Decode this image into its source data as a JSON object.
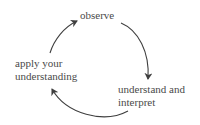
{
  "diagram": {
    "type": "cycle",
    "colors": {
      "text": "#4a4a4a",
      "arrow": "#3f3f3f"
    },
    "nodes": [
      {
        "id": "observe",
        "lines": [
          "observe"
        ]
      },
      {
        "id": "understand",
        "lines": [
          "understand and",
          "interpret"
        ]
      },
      {
        "id": "apply",
        "lines": [
          "apply your",
          "understanding"
        ]
      }
    ],
    "edges": [
      {
        "from": "observe",
        "to": "understand"
      },
      {
        "from": "understand",
        "to": "apply"
      },
      {
        "from": "apply",
        "to": "observe"
      }
    ]
  }
}
